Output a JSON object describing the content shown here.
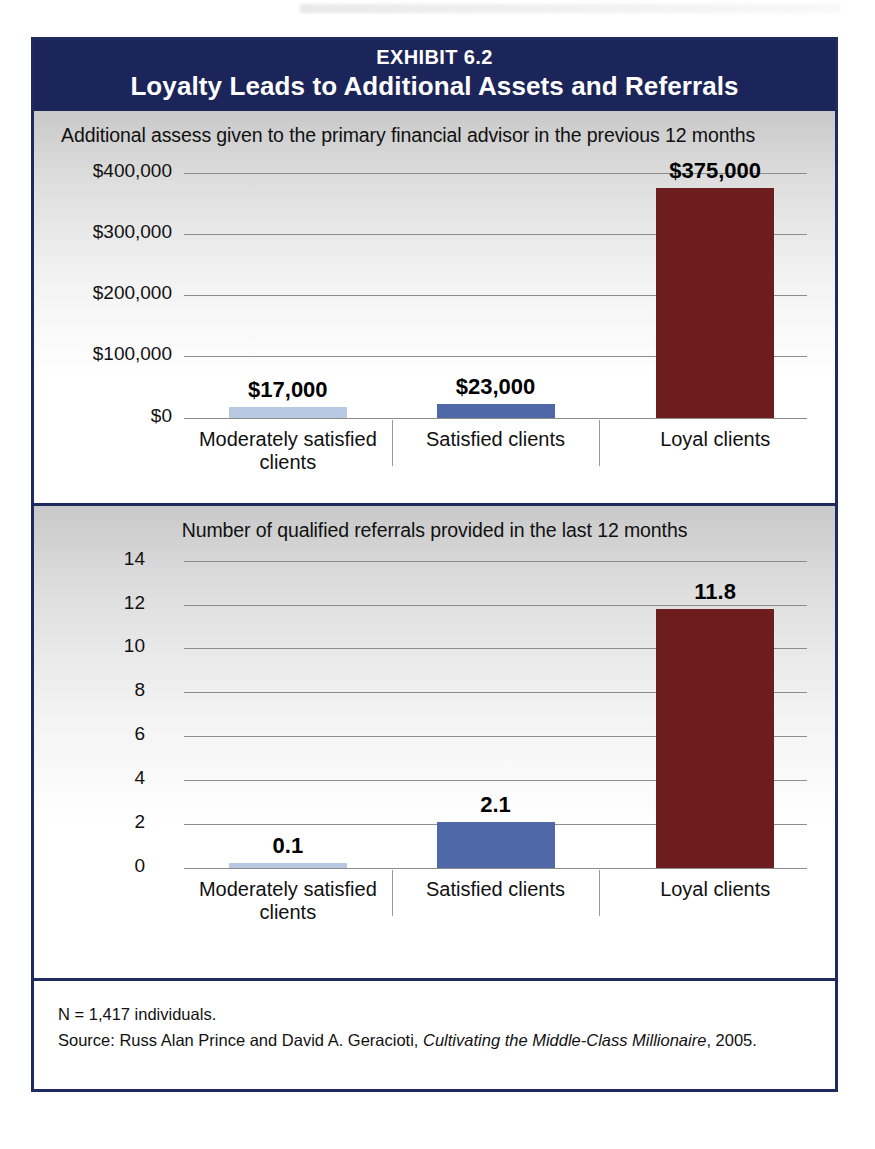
{
  "exhibit": {
    "eyebrow": "EXHIBIT 6.2",
    "title": "Loyalty Leads to Additional Assets and Referrals"
  },
  "footer": {
    "sample": "N = 1,417 individuals.",
    "source_prefix": "Source: Russ Alan Prince and David A. Geracioti, ",
    "source_title": "Cultivating the Middle-Class Millionaire",
    "source_suffix": ", 2005."
  },
  "colors": {
    "header_navy": "#1b2559",
    "border_navy": "#1f2a5e",
    "bar_light_blue": "#b7c8e2",
    "bar_medium_blue": "#4f68a8",
    "bar_dark_red": "#6d1d1d",
    "gridline": "#8d8d8d"
  },
  "chart_data": [
    {
      "type": "bar",
      "title": "Additional assess given to the primary financial advisor in the previous 12 months",
      "xlabel": "",
      "ylabel": "",
      "ylim": [
        0,
        400000
      ],
      "grid": true,
      "legend": "none",
      "categories": [
        "Moderately satisfied clients",
        "Satisfied clients",
        "Loyal clients"
      ],
      "values": [
        17000,
        23000,
        375000
      ],
      "data_labels": [
        "$17,000",
        "$23,000",
        "$375,000"
      ],
      "ticks": [
        {
          "value": 400000,
          "label": "$400,000"
        },
        {
          "value": 300000,
          "label": "$300,000"
        },
        {
          "value": 200000,
          "label": "$200,000"
        },
        {
          "value": 100000,
          "label": "$100,000"
        },
        {
          "value": 0,
          "label": "$0"
        }
      ],
      "bar_colors": [
        "#b7c8e2",
        "#4f68a8",
        "#6d1d1d"
      ]
    },
    {
      "type": "bar",
      "title": "Number of qualified referrals provided in the last 12 months",
      "xlabel": "",
      "ylabel": "",
      "ylim": [
        0,
        14
      ],
      "grid": true,
      "legend": "none",
      "categories": [
        "Moderately satisfied clients",
        "Satisfied clients",
        "Loyal clients"
      ],
      "values": [
        0.1,
        2.1,
        11.8
      ],
      "data_labels": [
        "0.1",
        "2.1",
        "11.8"
      ],
      "ticks": [
        {
          "value": 14,
          "label": "14"
        },
        {
          "value": 12,
          "label": "12"
        },
        {
          "value": 10,
          "label": "10"
        },
        {
          "value": 8,
          "label": "8"
        },
        {
          "value": 6,
          "label": "6"
        },
        {
          "value": 4,
          "label": "4"
        },
        {
          "value": 2,
          "label": "2"
        },
        {
          "value": 0,
          "label": "0"
        }
      ],
      "bar_colors": [
        "#b7c8e2",
        "#4f68a8",
        "#6d1d1d"
      ]
    }
  ]
}
